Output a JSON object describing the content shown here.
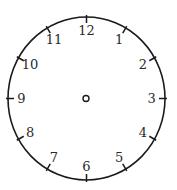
{
  "diagram": {
    "type": "analog-clock-face",
    "hands": "none",
    "center": {
      "x": 86.5,
      "y": 98.5
    },
    "radius": 79,
    "tick_length": 6,
    "label_radius": 66,
    "colors": {
      "stroke": "#1a1a1a",
      "text": "#2a2a2a",
      "background": "#ffffff"
    },
    "numbers": [
      "12",
      "1",
      "2",
      "3",
      "4",
      "5",
      "6",
      "7",
      "8",
      "9",
      "10",
      "11"
    ]
  }
}
